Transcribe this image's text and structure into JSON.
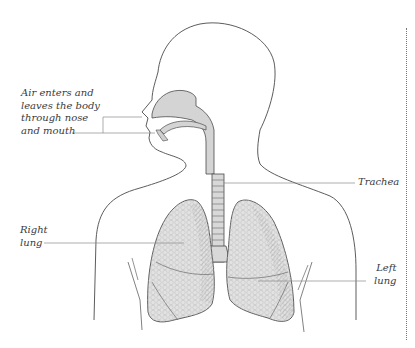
{
  "diagram": {
    "title": "",
    "labels": {
      "nose_mouth": "Air enters and\nleaves the body\nthrough nose\nand mouth",
      "trachea": "Trachea",
      "right_lung": "Right\nlung",
      "left_lung": "Left\nlung"
    },
    "colors": {
      "outline": "#4a4a4a",
      "airway_fill": "#d4d4d4",
      "lung_fill": "#e2e2e2",
      "leader_line": "#8a8a8a",
      "text": "#3a3a3a",
      "border": "#777777"
    }
  }
}
